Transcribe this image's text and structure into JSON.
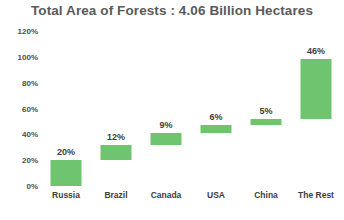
{
  "chart_data": {
    "type": "bar",
    "subtype": "waterfall-cumulative",
    "title": "Total Area of Forests : 4.06 Billion Hectares",
    "xlabel": "",
    "ylabel": "",
    "ylim": [
      0,
      120
    ],
    "ytick_values": [
      0,
      20,
      40,
      60,
      80,
      100,
      120
    ],
    "ytick_labels": [
      "0%",
      "20%",
      "40%",
      "60%",
      "80%",
      "100%",
      "120%"
    ],
    "grid": false,
    "legend": false,
    "bar_color": "#6fc56f",
    "categories": [
      "Russia",
      "Brazil",
      "Canada",
      "USA",
      "China",
      "The Rest"
    ],
    "values": [
      20,
      12,
      9,
      6,
      5,
      46
    ],
    "data_labels": [
      "20%",
      "12%",
      "9%",
      "6%",
      "5%",
      "46%"
    ],
    "bases": [
      0,
      20,
      32,
      41,
      47,
      52
    ],
    "cumulative": [
      20,
      32,
      41,
      47,
      52,
      98
    ]
  }
}
